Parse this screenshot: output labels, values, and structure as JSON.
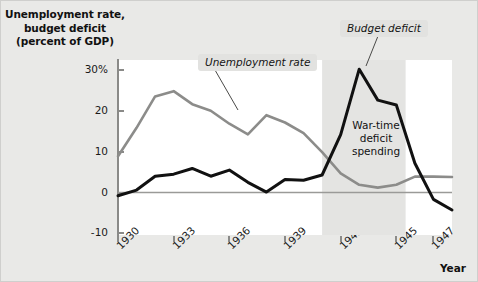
{
  "axis": {
    "y_title_line1": "Unemployment rate,",
    "y_title_line2": "budget deficit",
    "y_title_line3": "(percent of GDP)",
    "x_title": "Year",
    "y_ticks": [
      "30%",
      "20",
      "10",
      "0",
      "-10"
    ],
    "y_tick_values": [
      30,
      20,
      10,
      0,
      -10
    ],
    "x_ticks": [
      "1930",
      "1933",
      "1936",
      "1939",
      "1942",
      "1945",
      "1947"
    ],
    "x_tick_values": [
      1930,
      1933,
      1936,
      1939,
      1942,
      1945,
      1947
    ]
  },
  "annotations": {
    "unemployment_callout": "Unemployment rate",
    "deficit_callout": "Budget deficit",
    "band_line1": "War-time",
    "band_line2": "deficit",
    "band_line3": "spending"
  },
  "colors": {
    "unemployment_line": "#8c8c8a",
    "deficit_line": "#111111",
    "band_fill": "#e4e4e2",
    "plot_bg": "#ffffff",
    "figure_bg": "#e9e9e7",
    "axis": "#8a8a88",
    "zero_line": "#9a9a98",
    "callout_bg": "#e2e2e0"
  },
  "chart_data": {
    "type": "line",
    "title": "Unemployment rate, budget deficit (percent of GDP)",
    "xlabel": "Year",
    "ylabel": "Unemployment rate, budget deficit (percent of GDP)",
    "xlim": [
      1930,
      1948
    ],
    "ylim": [
      -10,
      32
    ],
    "grid": false,
    "legend": "annotated-callouts",
    "x": [
      1930,
      1931,
      1932,
      1933,
      1934,
      1935,
      1936,
      1937,
      1938,
      1939,
      1940,
      1941,
      1942,
      1943,
      1944,
      1945,
      1946,
      1947,
      1948
    ],
    "series": [
      {
        "name": "Unemployment rate",
        "color": "#8c8c8a",
        "values": [
          8.9,
          15.9,
          23.6,
          24.9,
          21.7,
          20.1,
          16.9,
          14.3,
          19.0,
          17.2,
          14.6,
          9.9,
          4.7,
          1.9,
          1.2,
          1.9,
          3.9,
          3.9,
          3.8
        ]
      },
      {
        "name": "Budget deficit",
        "color": "#111111",
        "values": [
          -0.8,
          0.6,
          4.0,
          4.5,
          5.9,
          4.0,
          5.5,
          2.5,
          0.1,
          3.2,
          3.0,
          4.3,
          14.2,
          30.3,
          22.7,
          21.5,
          7.2,
          -1.7,
          -4.3
        ]
      }
    ],
    "shaded_band": {
      "label": "War-time deficit spending",
      "x_start": 1941,
      "x_end": 1945.5,
      "color": "#e4e4e2"
    },
    "zero_line": 0
  }
}
